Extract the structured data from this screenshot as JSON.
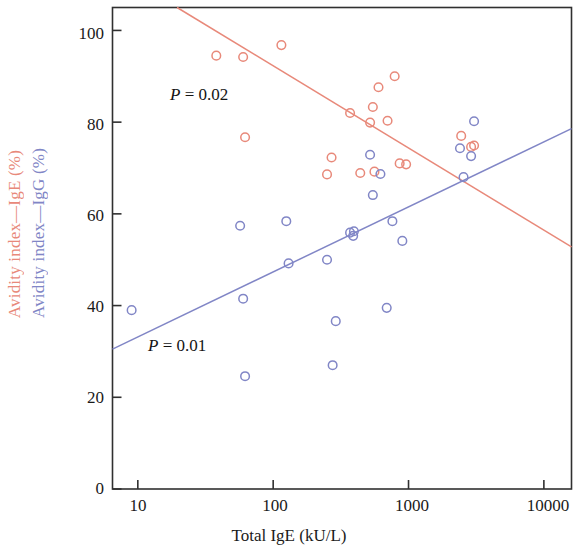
{
  "chart_data": {
    "type": "scatter",
    "title": "",
    "xlabel": "Total IgE (kU/L)",
    "xscale": "log",
    "xlim": [
      6.5,
      16000
    ],
    "xticks": [
      10,
      100,
      1000,
      10000
    ],
    "xticklabels": [
      "10",
      "100",
      "1000",
      "10000"
    ],
    "ylim": [
      0,
      105
    ],
    "yticks": [
      0,
      20,
      40,
      60,
      80,
      100
    ],
    "yticklabels": [
      "0",
      "20",
      "40",
      "60",
      "80",
      "100"
    ],
    "grid": false,
    "legend": "none",
    "ylabel_ige": "Avidity index—IgE (%)",
    "ylabel_igg": "Avidity index—IgG (%)",
    "series": [
      {
        "name": "Avidity index—IgE (%)",
        "color": "#E8897A",
        "marker": "open-circle",
        "annotation": "P = 0.02",
        "points": [
          [
            38,
            94.5
          ],
          [
            60,
            94.2
          ],
          [
            115,
            96.8
          ],
          [
            62,
            76.7
          ],
          [
            270,
            72.3
          ],
          [
            250,
            68.6
          ],
          [
            370,
            82.0
          ],
          [
            600,
            87.6
          ],
          [
            545,
            83.3
          ],
          [
            520,
            79.9
          ],
          [
            700,
            80.3
          ],
          [
            790,
            90.0
          ],
          [
            440,
            68.9
          ],
          [
            560,
            69.2
          ],
          [
            860,
            71.0
          ],
          [
            960,
            70.8
          ],
          [
            2450,
            77.0
          ],
          [
            2900,
            74.6
          ],
          [
            3050,
            74.9
          ]
        ],
        "trend": {
          "type": "linear-on-log",
          "x_start": 19.5,
          "y_start": 105,
          "x_end": 16000,
          "y_end": 52.8
        }
      },
      {
        "name": "Avidity index—IgG (%)",
        "color": "#8186C6",
        "marker": "open-circle",
        "annotation": "P = 0.01",
        "points": [
          [
            9,
            39.0
          ],
          [
            57,
            57.4
          ],
          [
            60,
            41.5
          ],
          [
            62,
            24.6
          ],
          [
            125,
            58.4
          ],
          [
            130,
            49.2
          ],
          [
            250,
            50.0
          ],
          [
            275,
            27.0
          ],
          [
            290,
            36.6
          ],
          [
            370,
            55.9
          ],
          [
            390,
            55.2
          ],
          [
            395,
            56.2
          ],
          [
            520,
            72.9
          ],
          [
            545,
            64.1
          ],
          [
            620,
            68.7
          ],
          [
            690,
            39.5
          ],
          [
            760,
            58.4
          ],
          [
            900,
            54.1
          ],
          [
            2400,
            74.3
          ],
          [
            2550,
            68.0
          ],
          [
            3050,
            80.2
          ],
          [
            2900,
            72.6
          ]
        ],
        "trend": {
          "type": "linear-on-log",
          "x_start": 6.5,
          "y_start": 30.5,
          "x_end": 16000,
          "y_end": 78.6
        }
      }
    ]
  },
  "axes": {
    "x_title": "Total IgE (kU/L)",
    "y_title_ige": "Avidity index—IgE (%)",
    "y_title_igg": "Avidity index—IgG (%)",
    "x_tick_labels": [
      "10",
      "100",
      "1000",
      "10000"
    ],
    "y_tick_labels": [
      "100",
      "80",
      "60",
      "40",
      "20",
      "0"
    ]
  },
  "annotations": {
    "p_ige": "P = 0.02",
    "p_igg": "P = 0.01",
    "p_symbol": "P",
    "p_ige_value": " = 0.02",
    "p_igg_value": " = 0.01"
  },
  "colors": {
    "ige": "#E8897A",
    "igg": "#8186C6",
    "axis": "#303030",
    "text": "#141414"
  }
}
